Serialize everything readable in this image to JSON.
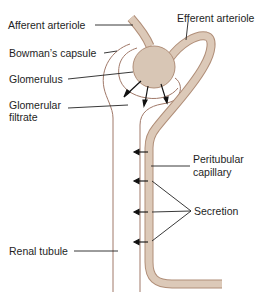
{
  "diagram": {
    "labels": {
      "afferent_arteriole": "Afferent arteriole",
      "efferent_arteriole": "Efferent arteriole",
      "bowmans_capsule": "Bowman’s capsule",
      "glomerulus": "Glomerulus",
      "glomerular_filtrate_line1": "Glomerular",
      "glomerular_filtrate_line2": "filtrate",
      "peritubular_capillary_line1": "Peritubular",
      "peritubular_capillary_line2": "capillary",
      "secretion": "Secretion",
      "renal_tubule": "Renal tubule"
    },
    "colors": {
      "vessel_fill": "#dcc9b8",
      "vessel_stroke": "#b08e78",
      "tubule_line": "#a07868",
      "leader_line": "#222222",
      "text": "#1e1e1e"
    },
    "filtration_arrows": 3,
    "secretion_arrows": 4
  }
}
